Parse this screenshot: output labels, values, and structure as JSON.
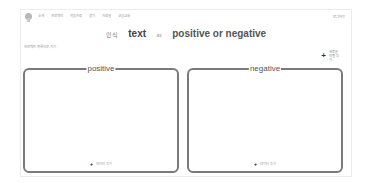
{
  "nav": {
    "items": [
      {
        "label": "소개"
      },
      {
        "label": "프로젝트"
      },
      {
        "label": "학습자료"
      },
      {
        "label": "묻기"
      },
      {
        "label": "자료실"
      },
      {
        "label": "코딩교육"
      }
    ],
    "right_label": "로그아웃"
  },
  "sub_label": "프로젝트 목록으로 가기",
  "title": {
    "prefix": "인식",
    "word": "text",
    "separator": "as",
    "rest": "positive or negative"
  },
  "add_category": {
    "icon": "plus-icon",
    "label": "새로운 라벨 추가"
  },
  "buckets": [
    {
      "label": "positive",
      "add_label": "데이터 추가",
      "icon": "plus-icon"
    },
    {
      "label": "negative",
      "add_label": "데이터 추가",
      "icon": "plus-icon"
    }
  ],
  "colors": {
    "box_border": "#7a7a7a",
    "page_border": "#ececec",
    "text_dark": "#444444"
  }
}
